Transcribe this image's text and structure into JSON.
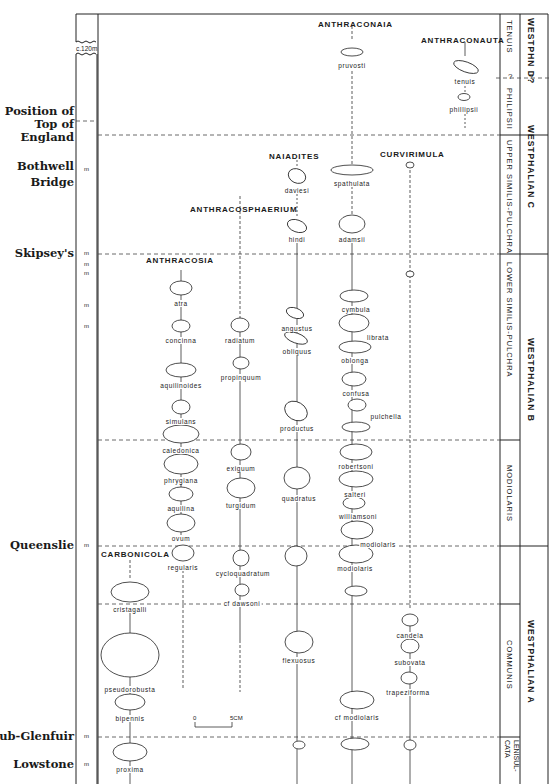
{
  "chart_data": {
    "type": "stratigraphic-range-chart",
    "title": "",
    "column_header": "c.120m",
    "localities": [
      {
        "name": "Position of Top of England",
        "lines": [
          "Position of",
          "Top of",
          "England"
        ],
        "y": 121
      },
      {
        "name": "Bothwell Bridge",
        "lines": [
          "Bothwell",
          "Bridge"
        ],
        "y": 170
      },
      {
        "name": "Skipsey's",
        "lines": [
          "Skipsey's"
        ],
        "y": 254
      },
      {
        "name": "Queenslie",
        "lines": [
          "Queenslie"
        ],
        "y": 546
      },
      {
        "name": "Sub-Glenfuir",
        "lines": [
          "Sub-Glenfuir"
        ],
        "y": 737
      },
      {
        "name": "Lowstone",
        "lines": [
          "Lowstone"
        ],
        "y": 765
      }
    ],
    "marker_ticks_y": [
      170,
      254,
      265,
      274,
      306,
      327,
      546,
      737,
      765
    ],
    "zones": [
      {
        "name": "TENUIS",
        "y0": 14,
        "y1": 78
      },
      {
        "name": "PHILIPSII",
        "y0": 78,
        "y1": 135
      },
      {
        "name": "UPPER SIMILIS-PULCHRA",
        "y0": 135,
        "y1": 254
      },
      {
        "name": "LOWER SIMILIS-PULCHRA",
        "y0": 254,
        "y1": 440
      },
      {
        "name": "MODIOLARIS",
        "y0": 440,
        "y1": 546
      },
      {
        "name": "COMMUNIS",
        "y0": 604,
        "y1": 737
      },
      {
        "name": "LENISUL-CATA",
        "y0": 737,
        "y1": 784
      }
    ],
    "stages": [
      {
        "name": "WESTPH N D?",
        "y0": 14,
        "y1": 78
      },
      {
        "name": "WESTPHALIAN C",
        "y0": 78,
        "y1": 254
      },
      {
        "name": "WESTPHALIAN B",
        "y0": 254,
        "y1": 546
      },
      {
        "name": "WESTPHALIAN A",
        "y0": 546,
        "y1": 784
      }
    ],
    "genera": [
      {
        "name": "ANTHRACONAIA",
        "x": 352,
        "species": [
          "pruvosti",
          "spathulata",
          "adamsii",
          "cymbula",
          "librata",
          "oblonga",
          "confusa",
          "pulchella",
          "robertsoni",
          "salteri",
          "williamsoni",
          "modiolaris",
          "modiolaris",
          "cf modiolaris"
        ]
      },
      {
        "name": "ANTHRACONAUTA",
        "x": 467,
        "species": [
          "tenuis",
          "phillipsii"
        ]
      },
      {
        "name": "NAIADITES",
        "x": 297,
        "species": [
          "daviesi",
          "hindi",
          "angustus",
          "obliquus",
          "productus",
          "quadratus",
          "flexuosus"
        ]
      },
      {
        "name": "CURVIRIMULA",
        "x": 410,
        "species": [
          "candela",
          "subovata",
          "trapeziforma"
        ]
      },
      {
        "name": "ANTHRACOSPHAERIUM",
        "x": 240,
        "species": [
          "radiatum",
          "propinquum",
          "exiguum",
          "turgidum",
          "cycloquadratum",
          "cf dawsoni"
        ]
      },
      {
        "name": "ANTHRACOSIA",
        "x": 181,
        "species": [
          "atra",
          "concinna",
          "aquilinoides",
          "simulans",
          "caledonica",
          "phrygiana",
          "aquilina",
          "ovum",
          "regularis"
        ]
      },
      {
        "name": "CARBONICOLA",
        "x": 130,
        "species": [
          "cristagalli",
          "pseudorobusta",
          "bipennis",
          "proxima"
        ]
      }
    ],
    "scale_bar": {
      "start": "0",
      "end": "5CM"
    }
  },
  "labels": {
    "col_header": "c.120m",
    "loc_top_1": "Position of",
    "loc_top_2": "Top of",
    "loc_top_3": "England",
    "loc_bothwell_1": "Bothwell",
    "loc_bothwell_2": "Bridge",
    "loc_skipsey": "Skipsey's",
    "loc_queenslie": "Queenslie",
    "loc_subglenfuir": "Sub-Glenfuir",
    "loc_lowstone": "Lowstone",
    "m": "m",
    "scale_0": "0",
    "scale_5": "5CM",
    "q1": "?",
    "q2": "?"
  },
  "genera": {
    "anthraconaia": "ANTHRACONAIA",
    "anthraconauta": "ANTHRACONAUTA",
    "naiadites": "NAIADITES",
    "curvirimula": "CURVIRIMULA",
    "anthracosphaerium": "ANTHRACOSPHAERIUM",
    "anthracosia": "ANTHRACOSIA",
    "carbonicola": "CARBONICOLA"
  },
  "zones": {
    "tenuis": "TENUIS",
    "philipsii": "PHILIPSII",
    "upper": "UPPER SIMILIS-PULCHRA",
    "lower": "LOWER SIMILIS-PULCHRA",
    "modiolaris": "MODIOLARIS",
    "communis": "COMMUNIS",
    "lenisulcata": "LENISUL-CATA"
  },
  "stages": {
    "d": "WESTPHN D?",
    "c": "WESTPHALIAN C",
    "b": "WESTPHALIAN B",
    "a": "WESTPHALIAN A"
  },
  "species": [
    {
      "key": "pruvosti",
      "label": "pruvosti",
      "x": 352,
      "y": 62
    },
    {
      "key": "tenuis",
      "label": "tenuis",
      "x": 465,
      "y": 78
    },
    {
      "key": "phillipsii",
      "label": "phillipsii",
      "x": 464,
      "y": 106
    },
    {
      "key": "daviesi",
      "label": "daviesi",
      "x": 297,
      "y": 187
    },
    {
      "key": "spathulata",
      "label": "spathulata",
      "x": 352,
      "y": 180
    },
    {
      "key": "hindi",
      "label": "hindi",
      "x": 297,
      "y": 236
    },
    {
      "key": "adamsii",
      "label": "adamsii",
      "x": 352,
      "y": 236
    },
    {
      "key": "atra",
      "label": "atra",
      "x": 181,
      "y": 300
    },
    {
      "key": "concinna",
      "label": "concinna",
      "x": 181,
      "y": 337
    },
    {
      "key": "radiatum",
      "label": "radiatum",
      "x": 240,
      "y": 337
    },
    {
      "key": "angustus",
      "label": "angustus",
      "x": 297,
      "y": 325
    },
    {
      "key": "obliquus",
      "label": "obliquus",
      "x": 297,
      "y": 348
    },
    {
      "key": "cymbula",
      "label": "cymbula",
      "x": 356,
      "y": 306
    },
    {
      "key": "librata",
      "label": "librata",
      "x": 378,
      "y": 334
    },
    {
      "key": "oblonga",
      "label": "oblonga",
      "x": 355,
      "y": 357
    },
    {
      "key": "propinquum",
      "label": "propinquum",
      "x": 241,
      "y": 374
    },
    {
      "key": "aquilinoides",
      "label": "aquilinoides",
      "x": 181,
      "y": 382
    },
    {
      "key": "confusa",
      "label": "confusa",
      "x": 356,
      "y": 390
    },
    {
      "key": "pulchella",
      "label": "pulchella",
      "x": 386,
      "y": 413
    },
    {
      "key": "simulans",
      "label": "simulans",
      "x": 181,
      "y": 418
    },
    {
      "key": "productus",
      "label": "productus",
      "x": 297,
      "y": 425
    },
    {
      "key": "caledonica",
      "label": "caledonica",
      "x": 181,
      "y": 447
    },
    {
      "key": "exiguum",
      "label": "exiguum",
      "x": 241,
      "y": 465
    },
    {
      "key": "robertsoni",
      "label": "robertsoni",
      "x": 356,
      "y": 463
    },
    {
      "key": "phrygiana",
      "label": "phrygiana",
      "x": 181,
      "y": 477
    },
    {
      "key": "salteri",
      "label": "salteri",
      "x": 355,
      "y": 491
    },
    {
      "key": "turgidum",
      "label": "turgidum",
      "x": 241,
      "y": 502
    },
    {
      "key": "quadratus",
      "label": "quadratus",
      "x": 299,
      "y": 495
    },
    {
      "key": "aquilina",
      "label": "aquilina",
      "x": 181,
      "y": 505
    },
    {
      "key": "williamsoni",
      "label": "williamsoni",
      "x": 358,
      "y": 513
    },
    {
      "key": "modiolaris_upper",
      "label": "modiolaris",
      "x": 378,
      "y": 541
    },
    {
      "key": "ovum",
      "label": "ovum",
      "x": 181,
      "y": 535
    },
    {
      "key": "regularis",
      "label": "regularis",
      "x": 183,
      "y": 564
    },
    {
      "key": "cycloquadratum",
      "label": "cycloquadratum",
      "x": 243,
      "y": 570
    },
    {
      "key": "modiolaris_lower",
      "label": "modiolaris",
      "x": 355,
      "y": 565
    },
    {
      "key": "cristagalli",
      "label": "cristagalli",
      "x": 130,
      "y": 606
    },
    {
      "key": "cf_dawsoni",
      "label": "cf dawsoni",
      "x": 242,
      "y": 600
    },
    {
      "key": "candela",
      "label": "candela",
      "x": 410,
      "y": 632
    },
    {
      "key": "flexuosus",
      "label": "flexuosus",
      "x": 299,
      "y": 657
    },
    {
      "key": "subovata",
      "label": "subovata",
      "x": 410,
      "y": 659
    },
    {
      "key": "trapeziforma",
      "label": "trapeziforma",
      "x": 408,
      "y": 689
    },
    {
      "key": "pseudorobusta",
      "label": "pseudorobusta",
      "x": 130,
      "y": 686
    },
    {
      "key": "bipennis",
      "label": "bipennis",
      "x": 130,
      "y": 715
    },
    {
      "key": "cf_modiolaris",
      "label": "cf modiolaris",
      "x": 357,
      "y": 714
    },
    {
      "key": "proxima",
      "label": "proxima",
      "x": 130,
      "y": 766
    }
  ]
}
